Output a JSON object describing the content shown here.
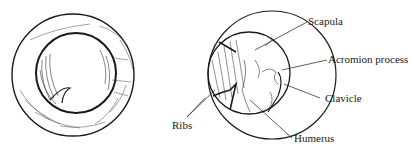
{
  "figure": {
    "left_view": {
      "description": "Shaded circular view with inner disc"
    },
    "right_view": {
      "labels": {
        "scapula": "Scapula",
        "acromion": "Acromion process",
        "clavicle": "Clavicle",
        "humerus": "Humerus",
        "ribs": "Ribs"
      }
    }
  }
}
